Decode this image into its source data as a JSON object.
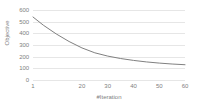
{
  "chart_data": {
    "type": "line",
    "title": "",
    "xlabel": "#Iteration",
    "ylabel": "Objective",
    "x": [
      1,
      5,
      10,
      15,
      20,
      25,
      30,
      35,
      40,
      45,
      50,
      55,
      60
    ],
    "values": [
      540,
      470,
      395,
      330,
      275,
      233,
      205,
      184,
      168,
      155,
      145,
      137,
      131
    ],
    "series": [
      {
        "name": "Objective",
        "values": [
          540,
          470,
          395,
          330,
          275,
          233,
          205,
          184,
          168,
          155,
          145,
          137,
          131
        ]
      }
    ],
    "xlim": [
      1,
      60
    ],
    "ylim": [
      0,
      600
    ],
    "xticks": [
      1,
      20,
      30,
      40,
      50,
      60
    ],
    "xtick_labels": [
      "1",
      "20",
      "30",
      "40",
      "50",
      "60"
    ],
    "yticks": [
      0,
      100,
      200,
      300,
      400,
      500,
      600
    ],
    "ytick_labels": [
      "0",
      "100",
      "200",
      "300",
      "400",
      "500",
      "600"
    ],
    "grid": true,
    "grid_axis": "y",
    "legend": false,
    "line_color": "#808080",
    "grid_color": "#e6e6e6",
    "text_color": "#808080",
    "background": "#ffffff"
  }
}
